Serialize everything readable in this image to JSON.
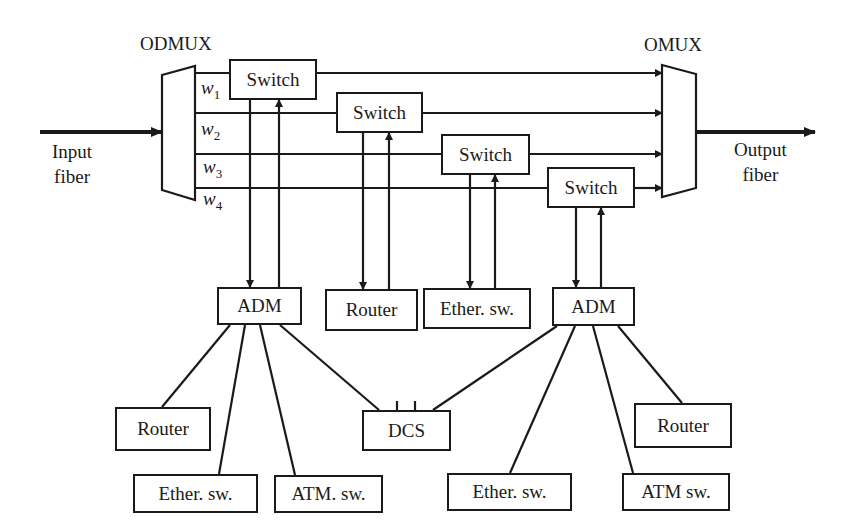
{
  "diagram": {
    "title_left": "ODMUX",
    "title_right": "OMUX",
    "input": {
      "line1": "Input",
      "line2": "fiber"
    },
    "output": {
      "line1": "Output",
      "line2": "fiber"
    },
    "wavelengths": [
      {
        "base": "w",
        "sub": "1"
      },
      {
        "base": "w",
        "sub": "2"
      },
      {
        "base": "w",
        "sub": "3"
      },
      {
        "base": "w",
        "sub": "4"
      }
    ],
    "switches": [
      {
        "label": "Switch",
        "x": 229,
        "y": 59,
        "w": 88,
        "h": 41
      },
      {
        "label": "Switch",
        "x": 336,
        "y": 92,
        "w": 87,
        "h": 41
      },
      {
        "label": "Switch",
        "x": 441,
        "y": 134,
        "w": 89,
        "h": 41
      },
      {
        "label": "Switch",
        "x": 547,
        "y": 167,
        "w": 88,
        "h": 41
      }
    ],
    "mid_nodes": [
      {
        "label": "ADM",
        "x": 217,
        "y": 287,
        "w": 85,
        "h": 38
      },
      {
        "label": "Router",
        "x": 325,
        "y": 289,
        "w": 93,
        "h": 42
      },
      {
        "label": "Ether. sw.",
        "x": 423,
        "y": 288,
        "w": 108,
        "h": 41
      },
      {
        "label": "ADM",
        "x": 552,
        "y": 287,
        "w": 83,
        "h": 39
      }
    ],
    "bottom_nodes": [
      {
        "label": "Router",
        "x": 115,
        "y": 407,
        "w": 96,
        "h": 44
      },
      {
        "label": "Ether. sw.",
        "x": 133,
        "y": 474,
        "w": 125,
        "h": 39
      },
      {
        "label": "ATM. sw.",
        "x": 274,
        "y": 475,
        "w": 109,
        "h": 38
      },
      {
        "label": "DCS",
        "x": 362,
        "y": 410,
        "w": 89,
        "h": 41
      },
      {
        "label": "Ether. sw.",
        "x": 447,
        "y": 473,
        "w": 125,
        "h": 38
      },
      {
        "label": "ATM sw.",
        "x": 622,
        "y": 473,
        "w": 108,
        "h": 38
      },
      {
        "label": "Router",
        "x": 634,
        "y": 403,
        "w": 98,
        "h": 45
      }
    ],
    "colors": {
      "stroke": "#1a1a1a",
      "background": "#ffffff"
    }
  }
}
